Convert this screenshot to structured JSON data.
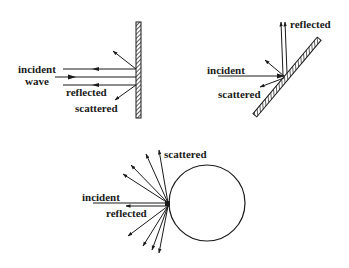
{
  "colors": {
    "ink": "#1a1a1a",
    "background": "#ffffff"
  },
  "panel_flat_wall": {
    "labels": {
      "incident": "incident",
      "wave": "wave",
      "reflected": "reflected",
      "scattered": "scattered"
    }
  },
  "panel_tilted_plate": {
    "labels": {
      "reflected": "reflected",
      "incident": "incident",
      "scattered": "scattered"
    }
  },
  "panel_sphere": {
    "labels": {
      "scattered": "scattered",
      "incident": "incident",
      "reflected": "reflected"
    }
  }
}
